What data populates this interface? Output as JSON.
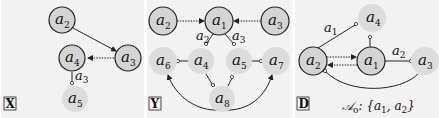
{
  "panels": [
    {
      "tag": "X",
      "nodes": [
        {
          "id": "a2",
          "base": "a",
          "sub": "2",
          "x": 62,
          "y": 20,
          "style": "dark"
        },
        {
          "id": "a3",
          "base": "a",
          "sub": "3",
          "x": 128,
          "y": 58,
          "style": "dark"
        },
        {
          "id": "a4",
          "base": "a",
          "sub": "4",
          "x": 72,
          "y": 58,
          "style": "dark"
        },
        {
          "id": "a5",
          "base": "a",
          "sub": "5",
          "x": 75,
          "y": 98,
          "style": "light"
        }
      ],
      "edges": [
        {
          "from": "a2",
          "to": "a3",
          "type": "solid-arrow"
        },
        {
          "from": "a3",
          "to": "a4",
          "type": "dotted-arrow"
        },
        {
          "from": "a4",
          "to": "a5",
          "type": "support",
          "label": "a3"
        }
      ]
    },
    {
      "tag": "Y",
      "nodes": [
        {
          "id": "a2",
          "base": "a",
          "sub": "2",
          "x": 163,
          "y": 21,
          "style": "dark"
        },
        {
          "id": "a1",
          "base": "a",
          "sub": "1",
          "x": 219,
          "y": 21,
          "style": "dark"
        },
        {
          "id": "a3",
          "base": "a",
          "sub": "3",
          "x": 275,
          "y": 21,
          "style": "dark"
        },
        {
          "id": "a6",
          "base": "a",
          "sub": "6",
          "x": 163,
          "y": 61,
          "style": "light"
        },
        {
          "id": "a4",
          "base": "a",
          "sub": "4",
          "x": 201,
          "y": 61,
          "style": "light"
        },
        {
          "id": "a5",
          "base": "a",
          "sub": "5",
          "x": 238,
          "y": 61,
          "style": "light"
        },
        {
          "id": "a7",
          "base": "a",
          "sub": "7",
          "x": 276,
          "y": 61,
          "style": "light"
        },
        {
          "id": "a8",
          "base": "a",
          "sub": "8",
          "x": 222,
          "y": 99,
          "style": "light"
        }
      ],
      "edges": [
        {
          "from": "a2",
          "to": "a1",
          "type": "dotted-arrow"
        },
        {
          "from": "a3",
          "to": "a1",
          "type": "dotted-arrow"
        },
        {
          "from": "a1",
          "to": "a4",
          "type": "support",
          "label": "a2"
        },
        {
          "from": "a1",
          "to": "a5",
          "type": "support",
          "label": "a3"
        },
        {
          "from": "a4",
          "to": "a6",
          "type": "support"
        },
        {
          "from": "a5",
          "to": "a7",
          "type": "support"
        },
        {
          "from": "a8",
          "to": "a4",
          "type": "support"
        },
        {
          "from": "a8",
          "to": "a5",
          "type": "support"
        },
        {
          "from": "a8",
          "to": "a6",
          "type": "curved-arrow"
        },
        {
          "from": "a8",
          "to": "a7",
          "type": "curved-arrow"
        }
      ]
    },
    {
      "tag": "D",
      "caption": "𝒜o: {a1, a2}",
      "caption_parts": {
        "set_symbol": "𝒜",
        "set_sub": "o",
        "open": ": {a",
        "s1": "1",
        "mid": ", a",
        "s2": "2",
        "close": "}"
      },
      "nodes": [
        {
          "id": "a4",
          "base": "a",
          "sub": "4",
          "x": 370,
          "y": 18,
          "style": "light"
        },
        {
          "id": "a2",
          "base": "a",
          "sub": "2",
          "x": 313,
          "y": 61,
          "style": "dark"
        },
        {
          "id": "a1",
          "base": "a",
          "sub": "1",
          "x": 371,
          "y": 61,
          "style": "dark"
        },
        {
          "id": "a3",
          "base": "a",
          "sub": "3",
          "x": 424,
          "y": 61,
          "style": "light"
        }
      ],
      "edges": [
        {
          "from": "a2",
          "to": "a4",
          "type": "support",
          "label": "a1"
        },
        {
          "from": "a1",
          "to": "a4",
          "type": "support"
        },
        {
          "from": "a2",
          "to": "a1",
          "type": "dotted-arrow"
        },
        {
          "from": "a1",
          "to": "a2",
          "type": "dotted-arrow"
        },
        {
          "from": "a1",
          "to": "a3",
          "type": "support",
          "label": "a2"
        },
        {
          "from": "a3",
          "to": "a2",
          "type": "curved-support"
        }
      ]
    }
  ],
  "colors": {
    "panel_bg": "#f2f2f2",
    "dark_node_fill": "#d4d4d4",
    "dark_node_stroke": "#222222",
    "light_node_fill": "#dcdcdc",
    "edge": "#222222"
  }
}
